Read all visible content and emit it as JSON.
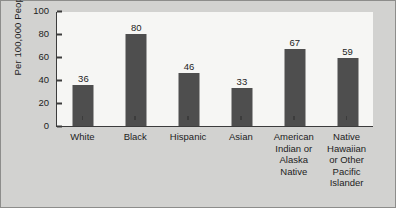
{
  "chart_data": {
    "type": "bar",
    "title": "",
    "xlabel": "",
    "ylabel": "Per 100,000 People",
    "ylim": [
      0,
      100
    ],
    "yticks": [
      0,
      20,
      40,
      60,
      80,
      100
    ],
    "grid": false,
    "legend": null,
    "bar_color": "#4e4e4e",
    "plot_background": "#f6f6f4",
    "figure_background": "#d2d2d0",
    "categories": [
      "White",
      "Black",
      "Hispanic",
      "Asian",
      "American Indian or Alaska Native",
      "Native Hawaiian or Other Pacific Islander"
    ],
    "category_lines": [
      [
        "White"
      ],
      [
        "Black"
      ],
      [
        "Hispanic"
      ],
      [
        "Asian"
      ],
      [
        "American",
        "Indian or",
        "Alaska",
        "Native"
      ],
      [
        "Native",
        "Hawaiian",
        "or Other",
        "Pacific",
        "Islander"
      ]
    ],
    "values": [
      36,
      80,
      46,
      33,
      67,
      59
    ],
    "value_labels": [
      "36",
      "80",
      "46",
      "33",
      "67",
      "59"
    ]
  }
}
